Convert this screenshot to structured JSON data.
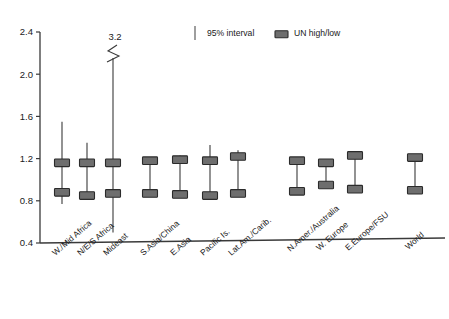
{
  "chart_data": {
    "type": "scatter",
    "title": "",
    "xlabel": "",
    "ylabel": "",
    "ylim": [
      0.4,
      2.4
    ],
    "ytick_labels": [
      "0.4",
      "0.8",
      "1.2",
      "1.6",
      "2.0",
      "2.4"
    ],
    "ytick_values": [
      0.4,
      0.8,
      1.2,
      1.6,
      2.0,
      2.4
    ],
    "grid": false,
    "legend_position": "top-center",
    "legend": [
      {
        "key": "interval",
        "label": "95% interval",
        "marker": "vertical-line",
        "color": "#6a6a6a"
      },
      {
        "key": "unhighlow",
        "label": "UN high/low",
        "marker": "filled-box",
        "color": "#6e6e6e"
      }
    ],
    "annotations": [
      {
        "text": "3.2",
        "category": "Mideast",
        "note": "axis break; upper 95% bound truncated at 3.2"
      }
    ],
    "categories": [
      "W./Mid Africa",
      "N/E/S Africa",
      "Mideast",
      "S.Asia/China",
      "E.Asia",
      "Pacific Is.",
      "Lat.Am./Carib.",
      "N.Amer./Australia",
      "W. Europe",
      "E.Europe/FSU",
      "World"
    ],
    "series": [
      {
        "name": "95% interval",
        "type": "range",
        "lower": [
          0.77,
          0.81,
          0.5,
          0.86,
          0.86,
          0.84,
          0.86,
          0.88,
          0.94,
          0.9,
          0.89
        ],
        "upper": [
          1.55,
          1.35,
          3.2,
          1.19,
          1.23,
          1.33,
          1.28,
          1.19,
          1.16,
          1.23,
          1.21
        ]
      },
      {
        "name": "UN high/low",
        "type": "marker-pair",
        "high": [
          1.16,
          1.16,
          1.16,
          1.18,
          1.19,
          1.18,
          1.22,
          1.18,
          1.16,
          1.23,
          1.21
        ],
        "low": [
          0.88,
          0.85,
          0.87,
          0.87,
          0.86,
          0.85,
          0.87,
          0.89,
          0.95,
          0.91,
          0.9
        ]
      }
    ],
    "x_positions_px": [
      62,
      87,
      113,
      150,
      180,
      210,
      238,
      297,
      326,
      355,
      415
    ],
    "mideast_break_top_px": 58
  }
}
